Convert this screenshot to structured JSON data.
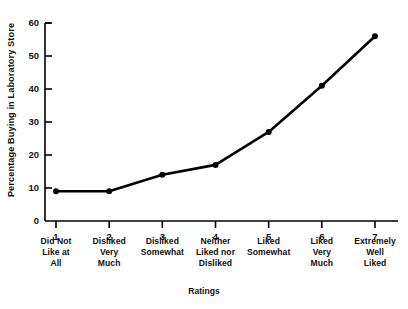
{
  "chart_data": {
    "type": "line",
    "title": "",
    "xlabel": "Ratings",
    "ylabel": "Percentage Buying in Laboratory Store",
    "x": [
      1,
      2,
      3,
      4,
      5,
      6,
      7
    ],
    "categories": [
      "1",
      "2",
      "3",
      "4",
      "5",
      "6",
      "7"
    ],
    "values": [
      9,
      9,
      14,
      17,
      27,
      41,
      56
    ],
    "series": [
      {
        "name": "Percentage Buying in Laboratory Store",
        "values": [
          9,
          9,
          14,
          17,
          27,
          41,
          56
        ]
      }
    ],
    "xlim": [
      0.6,
      7.4
    ],
    "ylim": [
      0,
      60
    ],
    "yticks": [
      0,
      10,
      20,
      30,
      40,
      50,
      60
    ],
    "ytick_labels": [
      "0",
      "10",
      "20",
      "30",
      "40",
      "50",
      "60"
    ],
    "xtick_labels": [
      "1",
      "2",
      "3",
      "4",
      "5",
      "6",
      "7"
    ],
    "category_labels": [
      [
        "Did Not",
        "Like at",
        "All"
      ],
      [
        "Disliked",
        "Very",
        "Much"
      ],
      [
        "Disliked",
        "Somewhat"
      ],
      [
        "Neither",
        "Liked nor",
        "Disliked"
      ],
      [
        "Liked",
        "Somewhat"
      ],
      [
        "Liked",
        "Very",
        "Much"
      ],
      [
        "Extremely",
        "Well",
        "Liked"
      ]
    ],
    "grid": false,
    "legend": false,
    "legend_position": "none",
    "marker": "filled-circle",
    "line_color": "#000000",
    "background_color": "#ffffff"
  },
  "axis": {
    "y_title": "Percentage Buying in Laboratory Store",
    "x_title": "Ratings"
  }
}
